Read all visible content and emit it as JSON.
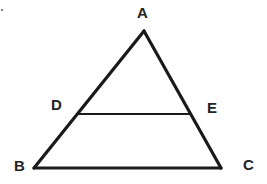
{
  "diagram": {
    "type": "geometry-triangle",
    "vertices": {
      "A": {
        "label": "A"
      },
      "B": {
        "label": "B"
      },
      "C": {
        "label": "C"
      },
      "D": {
        "label": "D",
        "on_side": "AB"
      },
      "E": {
        "label": "E",
        "on_side": "AC"
      }
    },
    "segments": [
      "AB",
      "AC",
      "BC",
      "DE"
    ],
    "colors": {
      "stroke": "#1a1a1a",
      "label": "#222222",
      "background": "#ffffff"
    }
  }
}
